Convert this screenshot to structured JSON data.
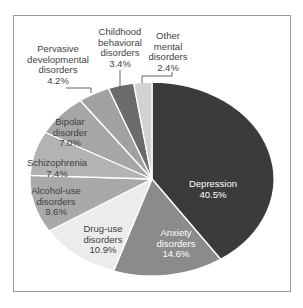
{
  "chart_data": {
    "type": "pie",
    "title": "",
    "direction": "clockwise",
    "start_angle": "12 o'clock",
    "categories": [
      "Depression",
      "Anxiety disorders",
      "Drug-use disorders",
      "Alcohol-use disorders",
      "Schizophrenia",
      "Bipolar disorder",
      "Pervasive developmental disorders",
      "Childhood behavioral disorders",
      "Other mental disorders"
    ],
    "values": [
      40.5,
      14.6,
      10.9,
      9.6,
      7.4,
      7.0,
      4.2,
      3.4,
      2.4
    ],
    "unit": "%",
    "legend": "none (labels on/around slices)"
  },
  "slices": [
    {
      "name": "depression",
      "lines": [
        "Depression",
        "40.5%"
      ],
      "value": 40.5,
      "color": "#3b3b3b",
      "text_color": "#ffffff"
    },
    {
      "name": "anxiety",
      "lines": [
        "Anxiety",
        "disorders",
        "14.6%"
      ],
      "value": 14.6,
      "color": "#8b8b8b",
      "text_color": "#ffffff"
    },
    {
      "name": "drug-use",
      "lines": [
        "Drug-use",
        "disorders",
        "10.9%"
      ],
      "value": 10.9,
      "color": "#ececec",
      "text_color": "#3f3f3f"
    },
    {
      "name": "alcohol-use",
      "lines": [
        "Alcohol-use",
        "disorders",
        "9.6%"
      ],
      "value": 9.6,
      "color": "#a9a9a9",
      "text_color": "#3f3f3f"
    },
    {
      "name": "schizophrenia",
      "lines": [
        "Schizophrenia",
        "7.4%"
      ],
      "value": 7.4,
      "color": "#b3b3b3",
      "text_color": "#3f3f3f"
    },
    {
      "name": "bipolar",
      "lines": [
        "Bipolar",
        "disorder",
        "7.0%"
      ],
      "value": 7.0,
      "color": "#a6a6a6",
      "text_color": "#3f3f3f"
    },
    {
      "name": "pervasive",
      "lines": [
        "Pervasive",
        "developmental",
        "disorders",
        "4.2%"
      ],
      "value": 4.2,
      "color": "#a1a1a1",
      "text_color": "#3f3f3f"
    },
    {
      "name": "childhood",
      "lines": [
        "Childhood",
        "behavioral",
        "disorders",
        "3.4%"
      ],
      "value": 3.4,
      "color": "#6b6b6b",
      "text_color": "#3f3f3f"
    },
    {
      "name": "other",
      "lines": [
        "Other",
        "mental",
        "disorders",
        "2.4%"
      ],
      "value": 2.4,
      "color": "#d2d2d2",
      "text_color": "#3f3f3f"
    }
  ]
}
